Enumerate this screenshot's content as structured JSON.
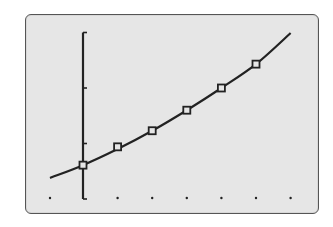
{
  "chart_data": {
    "type": "scatter",
    "title": "",
    "xlabel": "",
    "ylabel": "",
    "grid": false,
    "legend": null,
    "x_ticks": [
      -1,
      0,
      1,
      2,
      3,
      4,
      5,
      6
    ],
    "y_ticks": [
      0,
      1,
      2,
      3
    ],
    "xlim": [
      -1,
      6
    ],
    "ylim": [
      0,
      3
    ],
    "series": [
      {
        "name": "data points",
        "marker": "square",
        "x": [
          0,
          1,
          2,
          3,
          4,
          5
        ],
        "y": [
          0.61,
          0.94,
          1.23,
          1.6,
          2.0,
          2.43
        ]
      },
      {
        "name": "fitted curve",
        "type": "line",
        "x": [
          -1,
          0,
          1,
          2,
          3,
          4,
          5,
          6
        ],
        "y": [
          0.38,
          0.61,
          0.9,
          1.23,
          1.6,
          2.0,
          2.43,
          2.99
        ]
      }
    ]
  },
  "colors": {
    "screen_bg": "#e6e6e6",
    "ink": "#222222",
    "frame": "#555555"
  }
}
